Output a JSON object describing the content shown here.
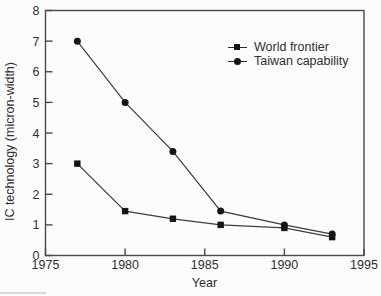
{
  "chart_data": {
    "type": "line",
    "x": [
      1977,
      1980,
      1983,
      1986,
      1990,
      1993
    ],
    "series": [
      {
        "name": "World frontier",
        "marker": "square",
        "values": [
          3.0,
          1.45,
          1.2,
          1.0,
          0.9,
          0.6
        ]
      },
      {
        "name": "Taiwan capability",
        "marker": "circle",
        "values": [
          7.0,
          5.0,
          3.4,
          1.45,
          1.0,
          0.7
        ]
      }
    ],
    "title": "",
    "xlabel": "Year",
    "ylabel": "IC technology (micron-width)",
    "xlim": [
      1975,
      1995
    ],
    "ylim": [
      0,
      8
    ],
    "xticks": [
      1975,
      1980,
      1985,
      1990,
      1995
    ],
    "yticks": [
      0,
      1,
      2,
      3,
      4,
      5,
      6,
      7,
      8
    ],
    "grid": false,
    "legend_position": "upper-right",
    "colors": {
      "line": "#3d3d3d",
      "marker": "#151515",
      "axis": "#4a4a4a",
      "text": "#2f2f2f",
      "background": "#fcfcfc"
    }
  }
}
